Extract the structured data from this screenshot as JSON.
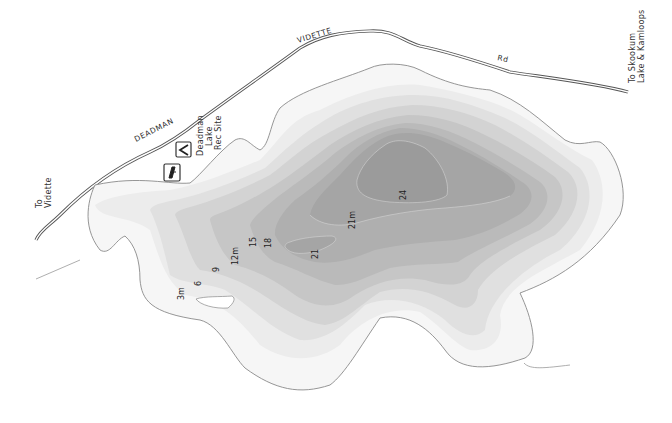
{
  "map": {
    "title": "Deadman Lake bathymetric map",
    "units": "m",
    "road": {
      "labels": [
        "DEADMAN",
        "VIDETTE",
        "Rd"
      ],
      "name": "Deadman Vidette Rd"
    },
    "destinations": {
      "west_line1": "To",
      "west_line2": "Vidette",
      "east_line1": "To Skookum",
      "east_line2": "Lake & Kamloops"
    },
    "rec_site": {
      "line1": "Deadman",
      "line2": "Lake",
      "line3": "Rec Site",
      "icons": [
        "campground-icon",
        "boat-launch-icon"
      ]
    },
    "depth_labels": {
      "d3": "3m",
      "d6": "6",
      "d9": "9",
      "d12": "12m",
      "d15": "15",
      "d18": "18",
      "d21a": "21",
      "d21b": "21m",
      "d24": "24"
    },
    "depth_colors": {
      "shore": "#f6f6f6",
      "d3": "#ececec",
      "d6": "#e0e0e0",
      "d9": "#d3d3d3",
      "d12": "#c6c6c6",
      "d15": "#bababa",
      "d18": "#afafaf",
      "d21": "#a5a5a5",
      "d24": "#9b9b9b",
      "shoreline": "#8a8a8a",
      "road": "#555555"
    }
  }
}
